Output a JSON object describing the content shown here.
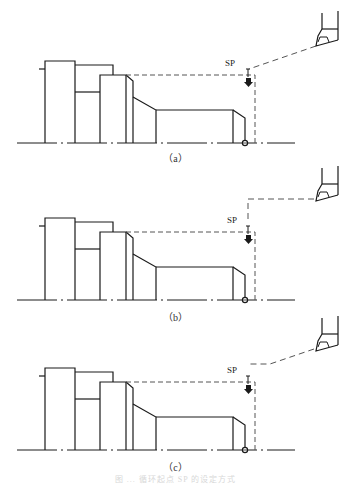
{
  "figure": {
    "panels": [
      {
        "id": "a",
        "label": "（a）",
        "sp_label": "SP",
        "offset_y": 0,
        "tool_path": "diagonal",
        "label_top": 150,
        "sp_top": 63
      },
      {
        "id": "b",
        "label": "（b）",
        "sp_label": "SP",
        "offset_y": -3,
        "tool_path": "right-angle",
        "label_top": 309,
        "sp_top": 218
      },
      {
        "id": "c",
        "label": "（c）",
        "sp_label": "SP",
        "offset_y": 0,
        "tool_path": "horizontal-then-diagonal",
        "label_top": 459,
        "sp_top": 369
      }
    ],
    "caption": "图 ... 循环起点 SP 的设定方式",
    "colors": {
      "line": "#1a1a1a",
      "dashed": "#555555",
      "background": "#ffffff"
    }
  }
}
